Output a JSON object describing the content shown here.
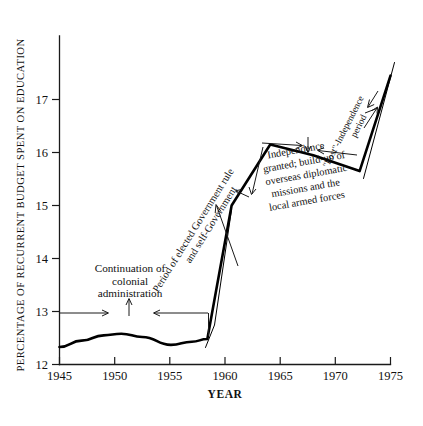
{
  "chart_data": {
    "type": "line",
    "title": "",
    "xlabel": "YEAR",
    "ylabel": "PERCENTAGE OF RECURRENT BUDGET SPENT ON EDUCATION",
    "xlim": [
      1945,
      1975
    ],
    "ylim": [
      12,
      17.6
    ],
    "xticks": [
      1945,
      1950,
      1955,
      1960,
      1965,
      1970,
      1975
    ],
    "xticklabels": [
      "1945",
      "1950",
      "1955",
      "1960",
      "1965",
      "1970",
      "1975"
    ],
    "yticks": [
      12,
      13,
      14,
      15,
      16,
      17
    ],
    "yticklabels": [
      "12",
      "13",
      "14",
      "15",
      "16",
      "17"
    ],
    "grid": false,
    "legend": "none",
    "series": [
      {
        "name": "Percentage of recurrent budget spent on education",
        "x": [
          1945,
          1947,
          1949,
          1950.6,
          1952.5,
          1955.1,
          1957,
          1958.4,
          1959.2,
          1960.6,
          1964.1,
          1968,
          1972.2,
          1975
        ],
        "values": [
          12.33,
          12.45,
          12.55,
          12.58,
          12.52,
          12.37,
          12.43,
          12.48,
          13.4,
          15.0,
          16.15,
          15.95,
          15.65,
          17.45
        ]
      }
    ],
    "annotations": [
      {
        "id": "colonial",
        "lines": [
          "Continuation of",
          "colonial",
          "administration"
        ],
        "span_years": [
          1945,
          1958.4
        ],
        "span_value": 13.0,
        "rotation": 0
      },
      {
        "id": "elected-government",
        "lines": [
          "Period of elected Government rule",
          "and self-Government"
        ],
        "span_years": [
          1958.6,
          1962.2
        ],
        "rotation": -58
      },
      {
        "id": "independence",
        "lines": [
          "Independence",
          "granted; build-up of",
          "overseas diplomatic",
          "missions and the",
          "local armed forces"
        ],
        "span_years": [
          1962.0,
          1968.3
        ],
        "rotation": -10
      },
      {
        "id": "post-independence",
        "lines": [
          "\"Post\"-Independence",
          "period"
        ],
        "span_years": [
          1972.4,
          1975
        ],
        "rotation": -63
      }
    ]
  },
  "figure": {
    "background_color": "#ffffff",
    "line_color": "#000000",
    "axis_color": "#1a1a1a"
  }
}
